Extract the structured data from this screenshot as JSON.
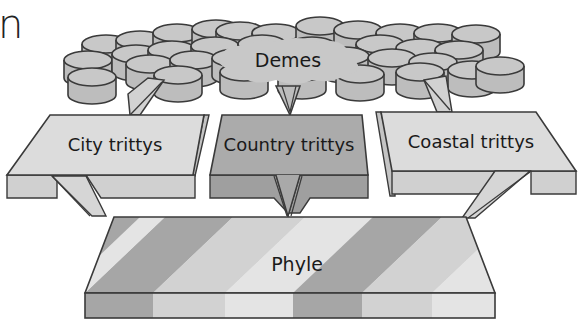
{
  "fragment": {
    "corner_text": "n"
  },
  "diagram": {
    "title": "",
    "nodes": {
      "demes": {
        "label": "Demes",
        "fill": "#c8c8c8"
      },
      "city_trittys": {
        "label": "City trittys",
        "fill": "#d6d6d6"
      },
      "country_trittys": {
        "label": "Country trittys",
        "fill": "#a9a9a9"
      },
      "coastal_trittys": {
        "label": "Coastal trittys",
        "fill": "#d6d6d6"
      },
      "phyle": {
        "label": "Phyle"
      }
    },
    "edges": [
      {
        "from": "demes",
        "to": "city_trittys"
      },
      {
        "from": "demes",
        "to": "country_trittys"
      },
      {
        "from": "demes",
        "to": "coastal_trittys"
      },
      {
        "from": "city_trittys",
        "to": "phyle"
      },
      {
        "from": "country_trittys",
        "to": "phyle"
      },
      {
        "from": "coastal_trittys",
        "to": "phyle"
      }
    ],
    "phyle_stripes": [
      "#a6a6a6",
      "#d2d2d2",
      "#e4e4e4",
      "#a6a6a6",
      "#d2d2d2",
      "#e4e4e4"
    ],
    "colors": {
      "stroke": "#3a3a3a",
      "cylinder": "#c6c6c6",
      "cylinder_side": "#bdbdbd"
    }
  }
}
